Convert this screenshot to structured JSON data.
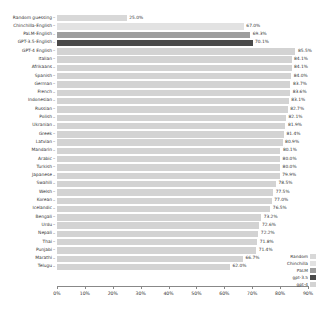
{
  "chart_data": {
    "type": "bar",
    "orientation": "horizontal",
    "title": "",
    "xlabel": "",
    "ylabel": "",
    "xlim": [
      0,
      90
    ],
    "grid": false,
    "legend_position": "bottom-right",
    "xticks": [
      "0%",
      "10%",
      "20%",
      "30%",
      "40%",
      "50%",
      "60%",
      "70%",
      "80%",
      "90%"
    ],
    "xtick_values": [
      0,
      10,
      20,
      30,
      40,
      50,
      60,
      70,
      80,
      90
    ],
    "categories": [
      "Random guessing",
      "Chinchilla-English",
      "PaLM-English",
      "GPT-3.5-English",
      "GPT-4 English",
      "Italian",
      "Afrikaans",
      "Spanish",
      "German",
      "French",
      "Indonesian",
      "Russian",
      "Polish",
      "Ukranian",
      "Greek",
      "Latvian",
      "Mandarin",
      "Arabic",
      "Turkish",
      "Japanese",
      "Swahili",
      "Welsh",
      "Korean",
      "Icelandic",
      "Bengali",
      "Urdu",
      "Nepali",
      "Thai",
      "Punjabi",
      "Marathi",
      "Telugu"
    ],
    "values": [
      25.0,
      67.0,
      69.3,
      70.1,
      85.5,
      84.1,
      84.1,
      84.0,
      83.7,
      83.6,
      83.1,
      82.7,
      82.1,
      81.9,
      81.4,
      80.9,
      80.1,
      80.0,
      80.0,
      79.9,
      78.5,
      77.5,
      77.0,
      76.5,
      73.2,
      72.6,
      72.2,
      71.8,
      71.4,
      66.7,
      62.0
    ],
    "value_labels": [
      "25.0%",
      "67.0%",
      "69.3%",
      "70.1%",
      "85.5%",
      "84.1%",
      "84.1%",
      "84.0%",
      "83.7%",
      "83.6%",
      "83.1%",
      "82.7%",
      "82.1%",
      "81.9%",
      "81.4%",
      "80.9%",
      "80.1%",
      "80.0%",
      "80.0%",
      "79.9%",
      "78.5%",
      "77.5%",
      "77.0%",
      "76.5%",
      "73.2%",
      "72.6%",
      "72.2%",
      "71.8%",
      "71.4%",
      "66.7%",
      "62.0%"
    ],
    "series_key": [
      "random",
      "chinchilla",
      "palm",
      "gpt35",
      "gpt4",
      "lang",
      "lang",
      "lang",
      "lang",
      "lang",
      "lang",
      "lang",
      "lang",
      "lang",
      "lang",
      "lang",
      "lang",
      "lang",
      "lang",
      "lang",
      "lang",
      "lang",
      "lang",
      "lang",
      "lang",
      "lang",
      "lang",
      "lang",
      "lang",
      "lang",
      "lang"
    ]
  },
  "legend": {
    "items": [
      {
        "label": "Random",
        "color": "#d8d8d8"
      },
      {
        "label": "Chinchilla",
        "color": "#e2e2e2"
      },
      {
        "label": "PaLM",
        "color": "#9e9e9e"
      },
      {
        "label": "gpt-3.5",
        "color": "#4a4a4a"
      },
      {
        "label": "gpt-4",
        "color": "#d3d3d3"
      }
    ]
  },
  "colors": {
    "random": "#d8d8d8",
    "chinchilla": "#e2e2e2",
    "palm": "#9e9e9e",
    "gpt35": "#4a4a4a",
    "gpt4": "#d3d3d3",
    "lang": "#d3d3d3",
    "axis": "#888888",
    "text": "#333333",
    "background": "#ffffff"
  }
}
